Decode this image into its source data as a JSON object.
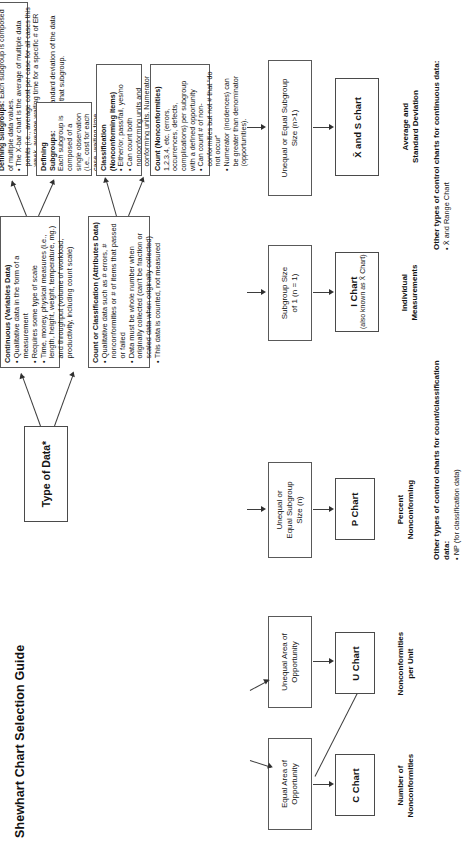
{
  "title": "Shewhart Chart Selection Guide",
  "root": {
    "label": "Type of Data*"
  },
  "branches": {
    "continuous": {
      "heading": "Continuous (Variables Data)",
      "bullets": [
        "Qualitative data in the form of a measurement",
        "Requires some type of scale",
        "Time, money, physical measures (i.e., length, height, weight, temperature, mg.) and throughput (volume of workload, productivity, including count scale)"
      ]
    },
    "attributes": {
      "heading": "Count or Classification (Attributes Data)",
      "bullets": [
        "Qualitative data such as # errors, # nonconformities or # of items that passed or failed",
        "Data must be whole number when originally collected (can't be fraction or scaled data when originally collected)",
        "This data is counted, not measured"
      ]
    }
  },
  "subgroups": {
    "single": {
      "heading": "Defining Subgroups:",
      "body": "Each subgroup is composed of a single observation (i.e., cost for each case, waiting time for each patient)."
    },
    "multiple": {
      "heading": "Defining Subgroups:",
      "lead": "Each subgroup is composed of multiple data values.",
      "bullets": [
        "The X-bar chart is the average of multiple data points (i.e., average cost per case for all cases this week, average waiting time for a specific # of ER patients [e.g., 5]).",
        "The S chart is the standard deviation of the data values that make up that subgroup."
      ]
    },
    "classification": {
      "heading": "Classification (Nonconforming Items)",
      "bullets": [
        "Either/or, pass/fail, yes/no",
        "Can count both nonconforming units and conforming units. Numerator cannot be greater than denominator(s)."
      ]
    },
    "count": {
      "heading": "Count (Nonconformities)",
      "lead": "1,2,3,4, etc. (errors, occurrences, defects, complications) per subgroup with a defined opportunity",
      "bullets": [
        "Can count # of non-conformities but not # that “do not occur”",
        "Numerator (incidences) can be greater than denominator (opportunities)."
      ]
    }
  },
  "sizes": {
    "n_equals_1": "Subgroup Size\nof 1 (n = 1)",
    "n_gt_1": "Unequal or Equal Subgroup\nSize (n>1)",
    "n_any": "Unequal or\nEqual Subgroup\nSize (n)",
    "equal_area": "Equal Area of\nOpportunity",
    "unequal_area": "Unequal Area of\nOpportunity"
  },
  "charts": [
    {
      "id": "c-chart",
      "name": "C Chart",
      "sub": "",
      "caption": "Number of\nNonconformities"
    },
    {
      "id": "u-chart",
      "name": "U Chart",
      "sub": "",
      "caption": "Nonconformities\nper Unit"
    },
    {
      "id": "p-chart",
      "name": "P Chart",
      "sub": "",
      "caption": "Percent\nNonconforming"
    },
    {
      "id": "i-chart",
      "name": "I Chart",
      "sub": "(also known as X̄ Chart)",
      "caption": "Individual\nMeasurements"
    },
    {
      "id": "xbar-s-chart",
      "name": "X̄ and S chart",
      "sub": "",
      "caption": "Average and\nStandard Deviation"
    }
  ],
  "notes": {
    "count_class": {
      "heading": "Other types of control charts for count/classification data:",
      "items": [
        "NP (for classification data)"
      ]
    },
    "continuous": {
      "heading": "Other types of control charts for continuous data:",
      "items": [
        "X̄ and Range Chart"
      ]
    }
  }
}
